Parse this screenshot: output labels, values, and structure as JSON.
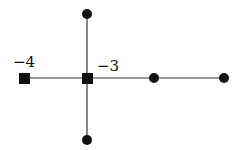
{
  "diagram": {
    "type": "graph",
    "nodes": [
      {
        "id": "n1",
        "shape": "square",
        "label": "−4",
        "x": 24,
        "y": 78
      },
      {
        "id": "n2",
        "shape": "square",
        "label": "−3",
        "x": 87,
        "y": 78
      },
      {
        "id": "n3",
        "shape": "circle",
        "label": "",
        "x": 87,
        "y": 14
      },
      {
        "id": "n4",
        "shape": "circle",
        "label": "",
        "x": 87,
        "y": 140
      },
      {
        "id": "n5",
        "shape": "circle",
        "label": "",
        "x": 154,
        "y": 78
      },
      {
        "id": "n6",
        "shape": "circle",
        "label": "",
        "x": 224,
        "y": 78
      }
    ],
    "edges": [
      [
        "n1",
        "n2"
      ],
      [
        "n2",
        "n3"
      ],
      [
        "n2",
        "n4"
      ],
      [
        "n2",
        "n5"
      ],
      [
        "n5",
        "n6"
      ]
    ],
    "labels": {
      "left_square": "−4",
      "center_square": "−3"
    },
    "color": "#111111"
  }
}
